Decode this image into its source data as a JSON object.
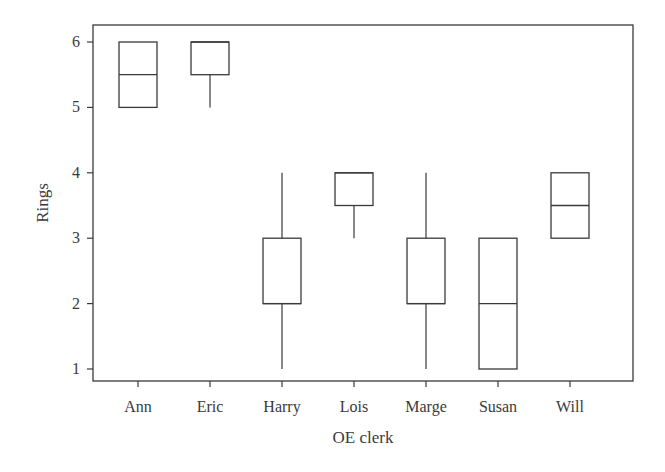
{
  "chart_data": {
    "type": "boxplot",
    "title": "",
    "xlabel": "OE clerk",
    "ylabel": "Rings",
    "categories": [
      "Ann",
      "Eric",
      "Harry",
      "Lois",
      "Marge",
      "Susan",
      "Will"
    ],
    "yticks": [
      1,
      2,
      3,
      4,
      5,
      6
    ],
    "ylim": [
      0.75,
      6.25
    ],
    "grid": false,
    "legend": null,
    "boxes": [
      {
        "name": "Ann",
        "min": 5,
        "q1": 5,
        "median": 5.5,
        "q3": 6,
        "max": 6
      },
      {
        "name": "Eric",
        "min": 5,
        "q1": 5.5,
        "median": 6,
        "q3": 6,
        "max": 6
      },
      {
        "name": "Harry",
        "min": 1,
        "q1": 2,
        "median": 2,
        "q3": 3,
        "max": 4
      },
      {
        "name": "Lois",
        "min": 3,
        "q1": 3.5,
        "median": 4,
        "q3": 4,
        "max": 4
      },
      {
        "name": "Marge",
        "min": 1,
        "q1": 2,
        "median": 2,
        "q3": 3,
        "max": 4
      },
      {
        "name": "Susan",
        "min": 1,
        "q1": 1,
        "median": 2,
        "q3": 3,
        "max": 3
      },
      {
        "name": "Will",
        "min": 3,
        "q1": 3,
        "median": 3.5,
        "q3": 4,
        "max": 4
      }
    ]
  },
  "style": {
    "line_color": "#3a3a3a",
    "background": "#ffffff"
  }
}
